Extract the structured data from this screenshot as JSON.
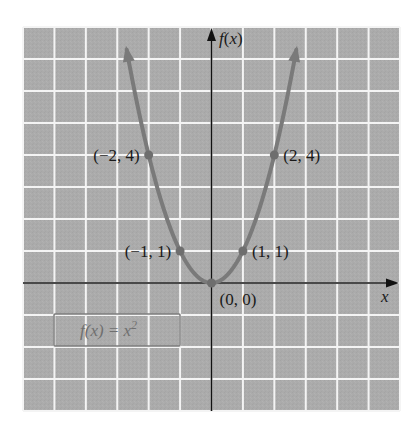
{
  "chart_data": {
    "type": "line",
    "title": "",
    "function": "f(x) = x^2",
    "xlabel": "x",
    "ylabel": "f(x)",
    "xlim": [
      -6,
      6
    ],
    "ylim": [
      -4,
      8
    ],
    "grid": true,
    "grid_step": 1,
    "tick_labels": false,
    "series": [
      {
        "name": "f(x) = x^2",
        "x": [
          -2.7,
          -2,
          -1,
          0,
          1,
          2,
          2.7
        ],
        "y": [
          7.29,
          4,
          1,
          0,
          1,
          4,
          7.29
        ],
        "arrows_at_ends": true
      }
    ],
    "points": [
      {
        "x": -2,
        "y": 4,
        "label": "(−2, 4)",
        "label_side": "left"
      },
      {
        "x": -1,
        "y": 1,
        "label": "(−1, 1)",
        "label_side": "left"
      },
      {
        "x": 0,
        "y": 0,
        "label": "(0, 0)",
        "label_side": "below-right"
      },
      {
        "x": 1,
        "y": 1,
        "label": "(1, 1)",
        "label_side": "right"
      },
      {
        "x": 2,
        "y": 4,
        "label": "(2, 4)",
        "label_side": "right"
      }
    ],
    "annotations": [
      {
        "text": "f(x) = x²",
        "type": "boxed-label",
        "position": "lower-left quadrant"
      }
    ],
    "colors": {
      "background": "#ffffff",
      "grid_fill": "#ababab",
      "grid_lines": "#f4f4f4",
      "axes": "#111111",
      "curve": "#7a7a7a",
      "points": "#6e6e6e",
      "label_box_border": "#7c7c7c",
      "label_box_text": "#6f6f6f"
    }
  },
  "labels": {
    "x_axis": "x",
    "y_axis_f": "f",
    "y_axis_paren_open": "(",
    "y_axis_x": "x",
    "y_axis_paren_close": ")",
    "function_box": "f(x) = x",
    "function_box_exp": "2"
  }
}
